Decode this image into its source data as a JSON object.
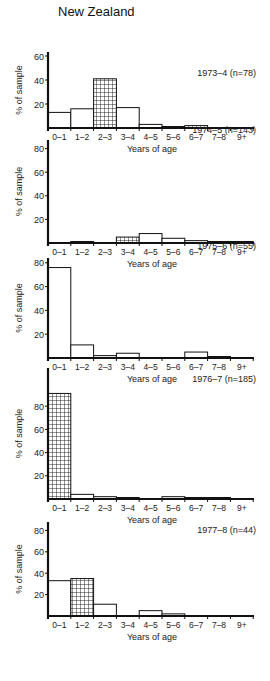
{
  "figure": {
    "title": "New Zealand"
  },
  "chart_data": [
    {
      "type": "bar",
      "title": "1973–4 (n=78)",
      "xlabel": "Years of age",
      "ylabel": "% of sample",
      "categories": [
        "0–1",
        "1–2",
        "2–3",
        "3–4",
        "4–5",
        "5–6",
        "6–7",
        "7–8",
        "9+"
      ],
      "values": [
        13,
        16,
        41,
        17,
        3,
        1,
        2,
        0,
        0
      ],
      "hatched": [
        false,
        false,
        true,
        false,
        false,
        false,
        true,
        false,
        false
      ],
      "yticks": [
        20,
        40,
        60
      ],
      "ylim": [
        0,
        60
      ],
      "grid": false
    },
    {
      "type": "bar",
      "title": "1974–5 (n=143)",
      "xlabel": "Years of age",
      "ylabel": "% of sample",
      "categories": [
        "0–1",
        "1–2",
        "2–3",
        "3–4",
        "4–5",
        "5–6",
        "6–7",
        "7–8",
        "9+"
      ],
      "values": [
        0,
        1,
        0,
        5,
        8,
        4,
        2,
        1,
        1
      ],
      "hatched": [
        false,
        false,
        false,
        true,
        false,
        false,
        false,
        false,
        false
      ],
      "yticks": [
        20,
        40,
        60,
        80
      ],
      "ylim": [
        0,
        80
      ],
      "grid": false
    },
    {
      "type": "bar",
      "title": "1975–6 (n=55)",
      "xlabel": "Years of age",
      "ylabel": "% of sample",
      "categories": [
        "0–1",
        "1–2",
        "2–3",
        "3–4",
        "4–5",
        "5–6",
        "6–7",
        "7–8",
        "9+"
      ],
      "values": [
        76,
        11,
        2,
        4,
        0,
        0,
        5,
        1,
        0
      ],
      "hatched": [
        false,
        false,
        false,
        false,
        false,
        false,
        false,
        false,
        false
      ],
      "yticks": [
        20,
        40,
        60,
        80
      ],
      "ylim": [
        0,
        80
      ],
      "grid": false
    },
    {
      "type": "bar",
      "title": "1976–7 (n=185)",
      "xlabel": "Years of age",
      "ylabel": "% of sample",
      "categories": [
        "0–1",
        "1–2",
        "2–3",
        "3–4",
        "4–5",
        "5–6",
        "6–7",
        "7–8",
        "9+"
      ],
      "values": [
        91,
        4,
        2,
        1,
        0,
        2,
        1,
        1,
        0
      ],
      "hatched": [
        true,
        false,
        false,
        false,
        false,
        false,
        false,
        false,
        false
      ],
      "yticks": [
        20,
        40,
        60,
        80
      ],
      "ylim": [
        0,
        100
      ],
      "grid": false
    },
    {
      "type": "bar",
      "title": "1977–8 (n=44)",
      "xlabel": "Years of age",
      "ylabel": "% of sample",
      "categories": [
        "0–1",
        "1–2",
        "2–3",
        "3–4",
        "4–5",
        "5–6",
        "6–7",
        "7–8",
        "9+"
      ],
      "values": [
        33,
        35,
        11,
        0,
        5,
        2,
        0,
        0,
        0
      ],
      "hatched": [
        false,
        true,
        false,
        false,
        false,
        false,
        false,
        false,
        false
      ],
      "yticks": [
        20,
        40,
        60,
        80
      ],
      "ylim": [
        0,
        80
      ],
      "grid": false
    }
  ],
  "layout": {
    "panels": [
      {
        "zero_y": 128,
        "unit_px": 1.2,
        "top_y": 52,
        "label_y": 106
      },
      {
        "zero_y": 243,
        "unit_px": 1.18,
        "top_y": 140,
        "label_y": 163
      },
      {
        "zero_y": 358,
        "unit_px": 1.19,
        "top_y": 258,
        "label_y": 279
      },
      {
        "zero_y": 499,
        "unit_px": 1.16,
        "top_y": 368,
        "label_y": 412
      },
      {
        "zero_y": 616,
        "unit_px": 1.07,
        "top_y": 522,
        "label_y": 563
      }
    ],
    "axis_x": 48,
    "bar_w": 22.8,
    "axis_end_x": 254
  }
}
